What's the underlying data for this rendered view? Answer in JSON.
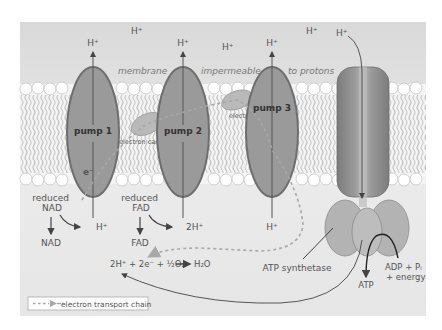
{
  "diagram": {
    "membrane_caption": [
      "membrane",
      "impermeable",
      "to protons"
    ],
    "pumps": [
      {
        "label": "pump 1",
        "top_ion": "H⁺",
        "bottom_ion": "H⁺"
      },
      {
        "label": "pump 2",
        "top_ion": "H⁺",
        "bottom_ion": "2H⁺"
      },
      {
        "label": "pump 3",
        "top_ion": "H⁺",
        "bottom_ion": "H⁺"
      }
    ],
    "free_ions_top": [
      "H⁺",
      "H⁺",
      "H⁺"
    ],
    "synthase_ion": "H⁺",
    "electron_label": "e⁻",
    "electron_carriers": [
      "electron carrier",
      "electron carrier"
    ],
    "reduced_nad": {
      "line1": "reduced",
      "line2": "NAD",
      "product": "NAD"
    },
    "reduced_fad": {
      "line1": "reduced",
      "line2": "FAD",
      "product": "FAD"
    },
    "water_equation": "2H⁺ + 2e⁻ + ½O₂",
    "water_product": "H₂O",
    "atp_synthetase_label": "ATP synthetase",
    "adp_label_line1": "ADP + Pᵢ",
    "adp_label_line2": "+ energy",
    "atp_label": "ATP",
    "legend": {
      "label": "electron transport chain"
    },
    "colors": {
      "background_top": "#e2e2e2",
      "background_bottom": "#ececec",
      "protein": "#9a9a9a",
      "protein_edge": "#6e6e6e",
      "synthase_head": "#b3b3b3",
      "dashed": "#a8a8a8",
      "text": "#555555"
    }
  }
}
